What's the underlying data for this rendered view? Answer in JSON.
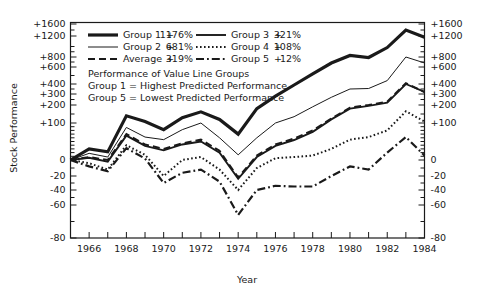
{
  "chart_data": {
    "type": "line",
    "title": "",
    "xlabel": "Year",
    "ylabel": "Stock Performance",
    "ylim": [
      -80,
      1600
    ],
    "xlim": [
      1965,
      1984
    ],
    "grid": false,
    "legend_position": "top-left-inside",
    "y_tick_labels": [
      "+1600",
      "+1200",
      "+800",
      "+600",
      "+400",
      "+300",
      "+200",
      "+100",
      "0",
      "-20",
      "-40",
      "-60",
      "-80"
    ],
    "y_tick_values": [
      1600,
      1200,
      800,
      600,
      400,
      300,
      200,
      100,
      0,
      -20,
      -40,
      -60,
      -80
    ],
    "y_minor_tick_values": [
      1400,
      1000,
      900,
      700,
      500,
      350,
      250,
      150,
      90,
      80,
      70,
      60,
      50,
      40,
      30,
      20,
      10,
      -10,
      -30,
      -50,
      -70
    ],
    "x_tick_values": [
      1965,
      1966,
      1967,
      1968,
      1969,
      1970,
      1971,
      1972,
      1973,
      1974,
      1975,
      1976,
      1977,
      1978,
      1979,
      1980,
      1981,
      1982,
      1983,
      1984
    ],
    "x_tick_labels": [
      "1966",
      "1968",
      "1970",
      "1972",
      "1974",
      "1976",
      "1978",
      "1980",
      "1982",
      "1984"
    ],
    "x_labeled_values": [
      1966,
      1968,
      1970,
      1972,
      1974,
      1976,
      1978,
      1980,
      1982,
      1984
    ],
    "x": [
      1965,
      1966,
      1967,
      1968,
      1969,
      1970,
      1971,
      1972,
      1973,
      1974,
      1975,
      1976,
      1977,
      1978,
      1979,
      1980,
      1981,
      1982,
      1983,
      1984
    ],
    "series": [
      {
        "name": "Group 1",
        "final_label": "+1176%",
        "style": "solid-thick",
        "width": 3.2,
        "color": "#1a1a1a",
        "values": [
          0,
          30,
          22,
          140,
          108,
          82,
          130,
          162,
          120,
          70,
          180,
          280,
          390,
          520,
          680,
          830,
          790,
          980,
          1400,
          1176
        ]
      },
      {
        "name": "Group 2",
        "final_label": "+681%",
        "style": "solid-thin",
        "width": 1.0,
        "color": "#1a1a1a",
        "values": [
          0,
          18,
          8,
          88,
          62,
          55,
          82,
          100,
          60,
          14,
          60,
          100,
          135,
          190,
          270,
          350,
          355,
          440,
          800,
          681
        ]
      },
      {
        "name": "Average",
        "final_label": "+319%",
        "style": "dashed",
        "width": 2.0,
        "color": "#1a1a1a",
        "values": [
          0,
          8,
          0,
          70,
          42,
          30,
          45,
          55,
          25,
          -22,
          12,
          42,
          58,
          80,
          125,
          185,
          200,
          230,
          410,
          319
        ]
      },
      {
        "name": "Group 3",
        "final_label": "+321%",
        "style": "solid-med",
        "width": 1.9,
        "color": "#1a1a1a",
        "values": [
          0,
          6,
          -2,
          66,
          38,
          26,
          42,
          50,
          20,
          -24,
          8,
          38,
          54,
          76,
          120,
          180,
          195,
          222,
          400,
          321
        ]
      },
      {
        "name": "Group 4",
        "final_label": "+108%",
        "style": "dotted",
        "width": 2.0,
        "color": "#1a1a1a",
        "values": [
          0,
          -4,
          -12,
          40,
          14,
          -20,
          0,
          8,
          -12,
          -40,
          -10,
          5,
          8,
          12,
          30,
          55,
          62,
          80,
          165,
          108
        ]
      },
      {
        "name": "Group 5",
        "final_label": "+12%",
        "style": "dashdot",
        "width": 2.2,
        "color": "#1a1a1a",
        "values": [
          0,
          -8,
          -14,
          32,
          4,
          -30,
          -16,
          -12,
          -28,
          -66,
          -40,
          -34,
          -35,
          -35,
          -20,
          -8,
          -12,
          20,
          62,
          12
        ]
      }
    ]
  },
  "legend": {
    "entries": [
      {
        "name": "Group 1",
        "sign": "+",
        "value": "1176%",
        "style": "solid-thick"
      },
      {
        "name": "Group 3",
        "sign": "+",
        "value": "321%",
        "style": "solid-med"
      },
      {
        "name": "Group 2",
        "sign": "+",
        "value": "681%",
        "style": "solid-thin"
      },
      {
        "name": "Group 4",
        "sign": "+",
        "value": "108%",
        "style": "dotted"
      },
      {
        "name": "Average",
        "sign": "+",
        "value": "319%",
        "style": "dashed"
      },
      {
        "name": "Group 5",
        "sign": "+",
        "value": "12%",
        "style": "dashdot"
      }
    ]
  },
  "annotation": {
    "lines": [
      "Performance of Value Line Groups",
      "Group 1 = Highest Predicted Performance",
      "Group 5 = Lowest Predicted Performance"
    ]
  },
  "axes": {
    "y_left_title": "Stock Performance",
    "x_title": "Year"
  },
  "colors": {
    "ink": "#1a1a1a",
    "background": "#ffffff"
  }
}
